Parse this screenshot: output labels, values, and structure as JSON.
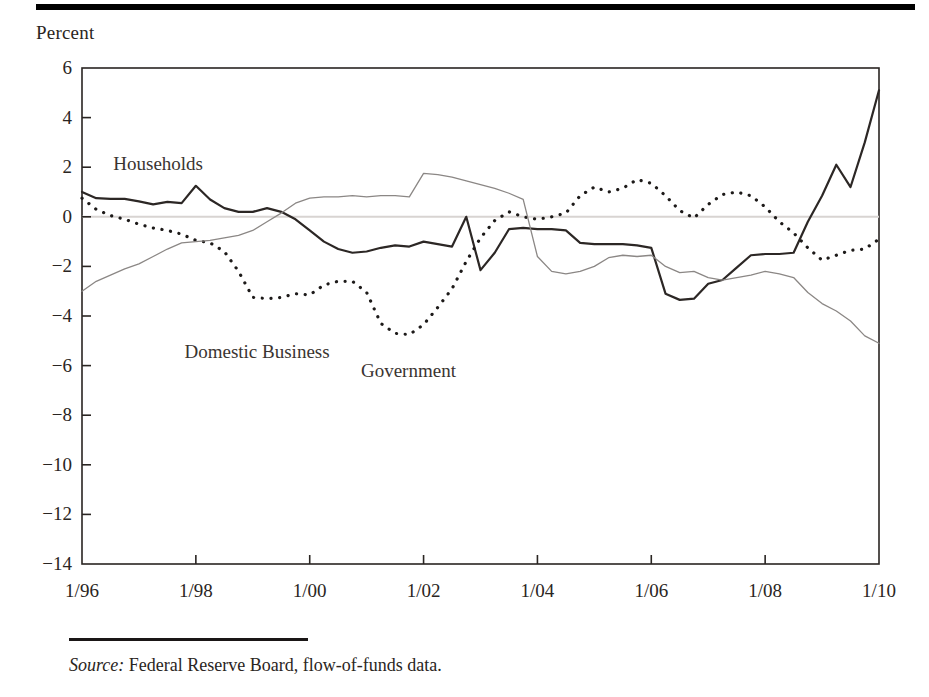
{
  "figure": {
    "y_axis_caption": "Percent",
    "source_label": "Source:",
    "source_text": " Federal Reserve Board, flow-of-funds data."
  },
  "chart_data": {
    "type": "line",
    "title": "",
    "subtitle": "",
    "xlabel": "",
    "ylabel": "Percent",
    "xlim": [
      1996.0,
      2010.0
    ],
    "ylim": [
      -14,
      6
    ],
    "yticks": [
      6,
      4,
      2,
      0,
      -2,
      -4,
      -6,
      -8,
      -10,
      -12,
      -14
    ],
    "ytick_labels": [
      "6",
      "4",
      "2",
      "0",
      "−2",
      "−4",
      "−6",
      "−8",
      "−10",
      "−12",
      "−14"
    ],
    "xticks": [
      1996,
      1998,
      2000,
      2002,
      2004,
      2006,
      2008,
      2010
    ],
    "xtick_labels": [
      "1/96",
      "1/98",
      "1/00",
      "1/02",
      "1/04",
      "1/06",
      "1/08",
      "1/10"
    ],
    "grid": false,
    "zero_line": true,
    "legend_position": "inline-annotations",
    "annotations": [
      {
        "text": "Households",
        "x": 1996.55,
        "y": 2.05
      },
      {
        "text": "Domestic Business",
        "x": 1997.8,
        "y": -5.55
      },
      {
        "text": "Government",
        "x": 2000.9,
        "y": -6.3
      }
    ],
    "x": [
      1996.0,
      1996.25,
      1996.5,
      1996.75,
      1997.0,
      1997.25,
      1997.5,
      1997.75,
      1998.0,
      1998.25,
      1998.5,
      1998.75,
      1999.0,
      1999.25,
      1999.5,
      1999.75,
      2000.0,
      2000.25,
      2000.5,
      2000.75,
      2001.0,
      2001.25,
      2001.5,
      2001.75,
      2002.0,
      2002.25,
      2002.5,
      2002.75,
      2003.0,
      2003.25,
      2003.5,
      2003.75,
      2004.0,
      2004.25,
      2004.5,
      2004.75,
      2005.0,
      2005.25,
      2005.5,
      2005.75,
      2006.0,
      2006.25,
      2006.5,
      2006.75,
      2007.0,
      2007.25,
      2007.5,
      2007.75,
      2008.0,
      2008.25,
      2008.5,
      2008.75,
      2009.0,
      2009.25,
      2009.5,
      2009.75,
      2010.0
    ],
    "series": [
      {
        "name": "Households",
        "style": "solid",
        "color": "#2c2725",
        "width": 2.2,
        "values": [
          1.0,
          0.75,
          0.72,
          0.72,
          0.62,
          0.5,
          0.6,
          0.55,
          1.25,
          0.7,
          0.35,
          0.2,
          0.2,
          0.35,
          0.2,
          -0.1,
          -0.55,
          -1.0,
          -1.3,
          -1.45,
          -1.4,
          -1.25,
          -1.15,
          -1.2,
          -1.0,
          -1.1,
          -1.2,
          0.0,
          -2.15,
          -1.45,
          -0.5,
          -0.45,
          -0.5,
          -0.5,
          -0.55,
          -1.05,
          -1.1,
          -1.1,
          -1.1,
          -1.15,
          -1.25,
          -3.1,
          -3.35,
          -3.3,
          -2.7,
          -2.55,
          -2.05,
          -1.55,
          -1.5,
          -1.5,
          -1.45,
          -0.2,
          0.85,
          2.1,
          1.2,
          3.0,
          5.1
        ]
      },
      {
        "name": "Domestic Business",
        "style": "dotted",
        "color": "#1d1a19",
        "width": 3.2,
        "values": [
          0.75,
          0.3,
          0.05,
          -0.1,
          -0.3,
          -0.45,
          -0.55,
          -0.7,
          -0.95,
          -1.05,
          -1.4,
          -2.2,
          -3.25,
          -3.3,
          -3.25,
          -3.1,
          -3.15,
          -2.75,
          -2.6,
          -2.6,
          -3.05,
          -4.3,
          -4.7,
          -4.75,
          -4.35,
          -3.65,
          -2.9,
          -1.8,
          -0.85,
          -0.15,
          0.2,
          0.0,
          -0.1,
          0.0,
          0.15,
          0.85,
          1.2,
          1.0,
          1.15,
          1.5,
          1.35,
          0.85,
          0.25,
          -0.05,
          0.5,
          0.9,
          1.0,
          0.85,
          0.4,
          -0.2,
          -0.65,
          -1.25,
          -1.75,
          -1.55,
          -1.35,
          -1.3,
          -0.9
        ]
      },
      {
        "name": "Government",
        "style": "solid",
        "color": "#8b8785",
        "width": 1.3,
        "values": [
          -3.0,
          -2.6,
          -2.35,
          -2.1,
          -1.9,
          -1.6,
          -1.3,
          -1.05,
          -1.0,
          -0.95,
          -0.85,
          -0.75,
          -0.55,
          -0.2,
          0.15,
          0.55,
          0.75,
          0.8,
          0.8,
          0.85,
          0.8,
          0.85,
          0.85,
          0.8,
          1.75,
          1.7,
          1.6,
          1.45,
          1.3,
          1.15,
          0.95,
          0.7,
          -1.6,
          -2.2,
          -2.3,
          -2.2,
          -2.0,
          -1.65,
          -1.55,
          -1.6,
          -1.55,
          -2.0,
          -2.25,
          -2.2,
          -2.45,
          -2.55,
          -2.45,
          -2.35,
          -2.2,
          -2.3,
          -2.45,
          -3.05,
          -3.5,
          -3.8,
          -4.2,
          -4.8,
          -5.1
        ]
      }
    ]
  }
}
